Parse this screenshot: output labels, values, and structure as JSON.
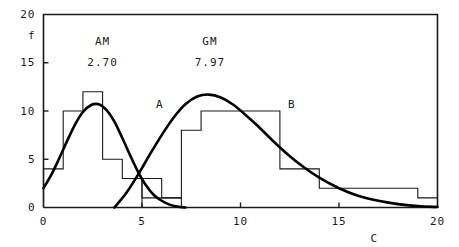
{
  "chart_data": {
    "type": "bar",
    "title": "",
    "subtitle": "",
    "xlabel": "C",
    "ylabel": "f",
    "xlim": [
      0,
      20
    ],
    "ylim": [
      0,
      20
    ],
    "grid": false,
    "legend": "inline-labels",
    "x_ticks": [
      {
        "value": 0,
        "label": "0"
      },
      {
        "value": 5,
        "label": "5"
      },
      {
        "value": 10,
        "label": "10"
      },
      {
        "value": 15,
        "label": "15"
      },
      {
        "value": 20,
        "label": "20"
      }
    ],
    "y_ticks": [
      {
        "value": 0,
        "label": "0"
      },
      {
        "value": 5,
        "label": "5"
      },
      {
        "value": 10,
        "label": "10"
      },
      {
        "value": 15,
        "label": "15"
      },
      {
        "value": 20,
        "label": "20"
      }
    ],
    "annotations": [
      {
        "name": "am-label",
        "text": "AM",
        "x": 3.0,
        "y": 17.2
      },
      {
        "name": "am-value",
        "text": "2.70",
        "x": 3.0,
        "y": 15.0
      },
      {
        "name": "gm-label",
        "text": "GM",
        "x": 8.45,
        "y": 17.2
      },
      {
        "name": "gm-value",
        "text": "7.97",
        "x": 8.45,
        "y": 15.0
      },
      {
        "name": "curve-a-label",
        "text": "A",
        "x": 5.9,
        "y": 10.6
      },
      {
        "name": "curve-b-label",
        "text": "B",
        "x": 12.6,
        "y": 10.6
      }
    ],
    "series": [
      {
        "name": "A",
        "type": "histogram",
        "bin_edges": [
          0,
          1,
          2,
          3,
          4,
          5,
          6,
          7
        ],
        "values": [
          4,
          10,
          12,
          5,
          3,
          1,
          1
        ]
      },
      {
        "name": "B",
        "type": "histogram",
        "bin_edges": [
          4,
          5,
          6,
          7,
          8,
          10,
          12,
          13,
          14,
          16,
          19,
          20
        ],
        "values": [
          0,
          3,
          1,
          8,
          10,
          10,
          4,
          4,
          2,
          2,
          1
        ]
      },
      {
        "name": "A-curve",
        "type": "line",
        "x": [
          0.0,
          0.4,
          0.8,
          1.2,
          1.6,
          2.0,
          2.4,
          2.8,
          3.2,
          3.6,
          4.0,
          4.4,
          4.8,
          5.2,
          5.6,
          6.0,
          6.4,
          6.8,
          7.2
        ],
        "y": [
          2.0,
          3.4,
          5.1,
          6.9,
          8.6,
          9.9,
          10.6,
          10.7,
          10.1,
          8.9,
          7.2,
          5.4,
          3.7,
          2.3,
          1.3,
          0.7,
          0.3,
          0.1,
          0.0
        ]
      },
      {
        "name": "B-curve",
        "type": "line",
        "x": [
          3.6,
          4.2,
          4.8,
          5.4,
          6.0,
          6.6,
          7.2,
          7.8,
          8.4,
          9.0,
          9.6,
          10.2,
          10.8,
          11.6,
          12.4,
          13.2,
          14.0,
          15.0,
          16.0,
          17.0,
          18.0,
          19.0,
          20.0
        ],
        "y": [
          0.0,
          1.5,
          3.4,
          5.5,
          7.5,
          9.3,
          10.7,
          11.5,
          11.7,
          11.4,
          10.7,
          9.7,
          8.6,
          7.0,
          5.5,
          4.2,
          3.1,
          2.0,
          1.2,
          0.7,
          0.35,
          0.15,
          0.05
        ]
      }
    ],
    "colors": {
      "axis": "#1a1a1a",
      "histogram": "#1a1a1a",
      "curve": "#000000",
      "background": "#ffffff"
    }
  },
  "axis": {
    "y_label": "f",
    "x_label": "C"
  }
}
